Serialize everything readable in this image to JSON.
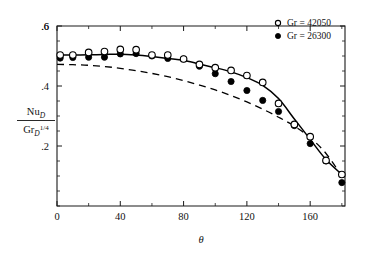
{
  "chart_data": {
    "type": "scatter",
    "title": "",
    "xlabel": "θ",
    "ylabel_numerator": "Nu",
    "ylabel_numerator_sub": "D",
    "ylabel_denominator": "Gr",
    "ylabel_denominator_sub": "D",
    "ylabel_denominator_sup": "1/4",
    "ylabel_plain": "Nu_D / Gr_D^(1/4)",
    "xlim": [
      0,
      182
    ],
    "ylim": [
      0,
      0.6
    ],
    "grid": false,
    "legend_position": "top-right",
    "x_ticks": [
      0,
      40,
      80,
      120,
      160
    ],
    "x_tick_labels": [
      "0",
      "40",
      "80",
      "120",
      "160"
    ],
    "x_minor_step": 20,
    "y_ticks": [
      0.2,
      0.4,
      0.6
    ],
    "y_tick_labels": [
      ".2",
      ".4",
      ".6"
    ],
    "y_minor_step": 0.05,
    "series": [
      {
        "name": "Gr = 42050",
        "marker": "open-circle",
        "x": [
          2,
          10,
          20,
          30,
          40,
          50,
          60,
          70,
          80,
          90,
          100,
          110,
          120,
          130,
          140,
          150,
          160,
          170,
          180
        ],
        "y": [
          0.503,
          0.503,
          0.512,
          0.515,
          0.522,
          0.521,
          0.503,
          0.503,
          0.49,
          0.472,
          0.461,
          0.452,
          0.435,
          0.412,
          0.342,
          0.272,
          0.231,
          0.152,
          0.105
        ]
      },
      {
        "name": "Gr = 26300",
        "marker": "filled-circle",
        "x": [
          2,
          10,
          20,
          30,
          40,
          50,
          60,
          70,
          80,
          90,
          100,
          110,
          120,
          130,
          140,
          150,
          160,
          170,
          180
        ],
        "y": [
          0.493,
          0.495,
          0.496,
          0.496,
          0.507,
          0.508,
          0.5,
          0.492,
          0.49,
          0.466,
          0.441,
          0.415,
          0.385,
          0.352,
          0.315,
          0.268,
          0.208,
          0.15,
          0.078
        ]
      }
    ],
    "curves": [
      {
        "name": "solid-fit-curve",
        "style": "solid",
        "x": [
          0,
          10,
          20,
          30,
          40,
          50,
          60,
          70,
          80,
          90,
          100,
          110,
          120,
          130,
          140,
          150,
          160,
          170,
          180
        ],
        "y": [
          0.503,
          0.503,
          0.504,
          0.505,
          0.506,
          0.503,
          0.498,
          0.492,
          0.486,
          0.473,
          0.461,
          0.447,
          0.428,
          0.402,
          0.358,
          0.29,
          0.222,
          0.155,
          0.105
        ]
      },
      {
        "name": "dashed-reference-curve",
        "style": "dashed",
        "x": [
          0,
          10,
          20,
          30,
          40,
          50,
          60,
          70,
          80,
          90,
          100,
          110,
          120,
          130,
          140,
          150,
          160,
          170,
          180
        ],
        "y": [
          0.472,
          0.471,
          0.469,
          0.465,
          0.459,
          0.451,
          0.442,
          0.431,
          0.418,
          0.403,
          0.387,
          0.368,
          0.347,
          0.323,
          0.296,
          0.266,
          0.228,
          0.175,
          0.1
        ]
      }
    ],
    "legend": [
      {
        "label": "Gr = 42050",
        "marker": "open-circle"
      },
      {
        "label": "Gr = 26300",
        "marker": "filled-circle"
      }
    ]
  }
}
